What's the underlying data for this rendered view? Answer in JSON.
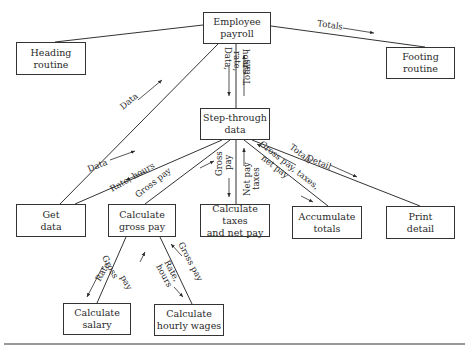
{
  "diagram": {
    "type": "structure-chart",
    "nodes": {
      "employee_payroll": [
        "Employee",
        "payroll"
      ],
      "heading_routine": [
        "Heading",
        "routine"
      ],
      "footing_routine": [
        "Footing",
        "routine"
      ],
      "step_through_data": [
        "Step-through",
        "data"
      ],
      "get_data": [
        "Get",
        "data"
      ],
      "calculate_gross_pay": [
        "Calculate",
        "gross pay"
      ],
      "calculate_taxes": [
        "Calculate taxes",
        "and net pay"
      ],
      "accumulate_totals": [
        "Accumulate",
        "totals"
      ],
      "print_detail": [
        "Print",
        "detail"
      ],
      "calculate_salary": [
        "Calculate",
        "salary"
      ],
      "calculate_hourly_wages": [
        "Calculate",
        "hourly wages"
      ]
    },
    "labels": {
      "totals_to_footing": "Totals",
      "data_to_payroll": "Data",
      "payroll_down": [
        "Data,",
        "rate,",
        "hours"
      ],
      "step_up_totals": "Totals",
      "get_data": "Data",
      "rate_hours": "Rate, hours",
      "gross_pay_up": "Gross pay",
      "gross_pay_down": [
        "Gross",
        "pay"
      ],
      "net_pay_taxes": [
        "Net pay",
        "taxes"
      ],
      "gross_taxes_net": [
        "Gross pay, taxes,",
        "net pay"
      ],
      "totals_up": "Totals",
      "detail": "Detail",
      "salary_rate": "Rate",
      "salary_gross": [
        "Gross",
        "pay"
      ],
      "hourly_rate": [
        "Rate,",
        "hours"
      ],
      "hourly_gross": "Gross pay"
    }
  }
}
